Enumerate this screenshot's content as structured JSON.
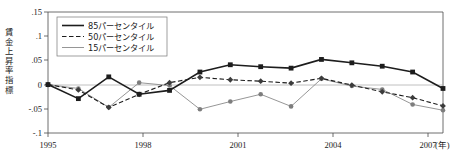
{
  "chart_data": {
    "type": "line",
    "title": "",
    "xlabel": "(年)",
    "ylabel": "賃金上昇率指標",
    "xlim": [
      1995,
      2008
    ],
    "ylim": [
      -0.1,
      0.15
    ],
    "yticks": [
      ".15",
      ".1",
      ".05",
      "0",
      "-.05",
      "-.1"
    ],
    "ytick_values": [
      0.15,
      0.1,
      0.05,
      0,
      -0.05,
      -0.1
    ],
    "xticks": [
      "1995",
      "1998",
      "2001",
      "2004",
      "2007"
    ],
    "xtick_values": [
      1995,
      1998,
      2001,
      2004,
      2007
    ],
    "x": [
      1995,
      1996,
      1997,
      1998,
      1999,
      2000,
      2001,
      2002,
      2003,
      2004,
      2005,
      2006,
      2007,
      2008
    ],
    "grid": false,
    "zero_line": true,
    "legend_position": "top-left",
    "series": [
      {
        "name": "85パーセンタイル",
        "style": "solid-thick",
        "marker": "square",
        "color": "#1d1d1d",
        "values": [
          0.0,
          -0.029,
          0.016,
          -0.02,
          -0.012,
          0.026,
          0.041,
          0.037,
          0.034,
          0.052,
          0.045,
          0.038,
          0.026,
          -0.008
        ]
      },
      {
        "name": "50パーセンタイル",
        "style": "dashed",
        "marker": "diamond",
        "color": "#3c3c3c",
        "values": [
          0.0,
          -0.011,
          -0.047,
          -0.02,
          0.004,
          0.015,
          0.01,
          0.007,
          0.003,
          0.013,
          -0.001,
          -0.015,
          -0.027,
          -0.044
        ]
      },
      {
        "name": "15パーセンタイル",
        "style": "solid-thin",
        "marker": "circle",
        "color": "#8a8a8a",
        "values": [
          0.0,
          -0.008,
          -0.047,
          0.004,
          -0.002,
          -0.051,
          -0.035,
          -0.02,
          -0.045,
          0.012,
          -0.003,
          -0.01,
          -0.041,
          -0.053
        ]
      }
    ]
  },
  "legend": {
    "items": [
      {
        "label": "85パーセンタイル"
      },
      {
        "label": "50パーセンタイル"
      },
      {
        "label": "15パーセンタイル"
      }
    ]
  },
  "axes": {
    "y_axis_title": "賃金上昇率指標",
    "x_unit_label": "(年)"
  }
}
